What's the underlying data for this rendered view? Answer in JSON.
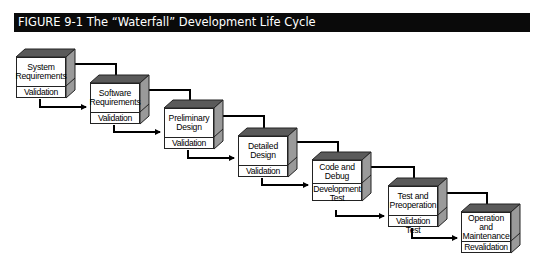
{
  "figure": {
    "title": "FIGURE 9-1  The “Waterfall” Development Life Cycle"
  },
  "colors": {
    "title_bg": "#0a0a0a",
    "title_fg": "#ffffff",
    "box_top": "#5a5a5a",
    "box_side": "#9a9a9a",
    "arrow": "#000000"
  },
  "stages": [
    {
      "name": "System Requirements",
      "line1": "System",
      "line2": "Requirements",
      "line3": "",
      "check": "Validation",
      "check2": ""
    },
    {
      "name": "Software Requirements",
      "line1": "Software",
      "line2": "Requirements",
      "line3": "",
      "check": "Validation",
      "check2": ""
    },
    {
      "name": "Preliminary Design",
      "line1": "Preliminary",
      "line2": "Design",
      "line3": "",
      "check": "Validation",
      "check2": ""
    },
    {
      "name": "Detailed Design",
      "line1": "Detailed",
      "line2": "Design",
      "line3": "",
      "check": "Validation",
      "check2": ""
    },
    {
      "name": "Code and Debug",
      "line1": "Code and",
      "line2": "Debug",
      "line3": "",
      "check": "Development",
      "check2": "Test"
    },
    {
      "name": "Test and Preoperation",
      "line1": "Test and",
      "line2": "Preoperation",
      "line3": "",
      "check": "Validation Test",
      "check2": ""
    },
    {
      "name": "Operation and Maintenance",
      "line1": "Operation",
      "line2": "and",
      "line3": "Maintenance",
      "check": "Revalidation",
      "check2": ""
    }
  ]
}
